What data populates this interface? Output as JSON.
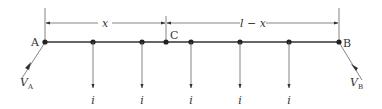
{
  "diagram": {
    "colors": {
      "line": "#555555",
      "beam": "#333333",
      "text": "#333333",
      "background": "#ffffff"
    },
    "beam": {
      "start_label": "A",
      "end_label": "B",
      "split_label": "C"
    },
    "dimensions": {
      "left": "x",
      "right": "l − x"
    },
    "reactions": {
      "left": {
        "symbol": "V",
        "subscript": "A"
      },
      "right": {
        "symbol": "V",
        "subscript": "B"
      }
    },
    "loads": [
      {
        "label": "i"
      },
      {
        "label": "i"
      },
      {
        "label": "i"
      },
      {
        "label": "i"
      },
      {
        "label": "i"
      }
    ]
  }
}
